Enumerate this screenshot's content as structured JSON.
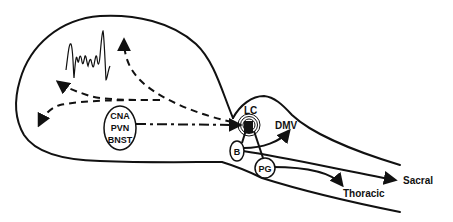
{
  "diagram": {
    "type": "neuroanatomical pathway schematic (sagittal brain and spinal cord)",
    "regions": {
      "forebrain_nuclei": {
        "lines": [
          "CNA",
          "PVN",
          "BNST"
        ]
      },
      "locus_coeruleus": {
        "label": "LC"
      },
      "dmv": {
        "label": "DMV"
      },
      "barrington": {
        "label": "B"
      },
      "paragigantocellularis": {
        "label": "PG"
      },
      "thoracic": {
        "label": "Thoracic"
      },
      "sacral": {
        "label": "Sacral"
      }
    },
    "connections": [
      {
        "from": "CNA/PVN/BNST",
        "to": "LC",
        "style": "dash-dot arrow"
      },
      {
        "from": "LC",
        "to": "cortex (up)",
        "style": "dashed arrow"
      },
      {
        "from": "LC",
        "to": "cortex (left-upper)",
        "style": "dashed arrow"
      },
      {
        "from": "LC",
        "to": "cortex (left-lower)",
        "style": "dashed arrow"
      },
      {
        "from": "LC/B",
        "to": "DMV",
        "style": "solid arrow"
      },
      {
        "from": "B",
        "to": "Sacral",
        "style": "solid arrow"
      },
      {
        "from": "PG",
        "to": "Thoracic",
        "style": "solid arrow"
      },
      {
        "from": "B",
        "to": "LC",
        "style": "solid line"
      },
      {
        "from": "PG",
        "to": "LC",
        "style": "solid line"
      }
    ],
    "eeg_trace": "cortical EEG activation waveform"
  }
}
